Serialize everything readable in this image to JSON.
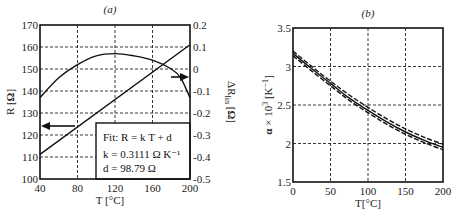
{
  "chart_data": [
    {
      "panel": "(a)",
      "type": "line",
      "title": "(a)",
      "xlabel": "T [°C]",
      "ylabel": "R [Ω]",
      "y2label": "ΔR_lin [Ω]",
      "xlim": [
        40,
        200
      ],
      "ylim": [
        100,
        170
      ],
      "y2lim": [
        -0.5,
        0.2
      ],
      "xticks": [
        "40",
        "80",
        "120",
        "160",
        "200"
      ],
      "yticks": [
        "100",
        "110",
        "120",
        "130",
        "140",
        "150",
        "160",
        "170"
      ],
      "y2ticks": [
        "-0.5",
        "-0.4",
        "-0.3",
        "-0.2",
        "-0.1",
        "0",
        "0.1",
        "0.2"
      ],
      "grid": true,
      "series": [
        {
          "name": "R (linear fit)",
          "axis": "left",
          "x": [
            40,
            80,
            120,
            160,
            200
          ],
          "values": [
            111.2,
            123.7,
            136.1,
            148.6,
            161.0
          ]
        },
        {
          "name": "ΔR_lin",
          "axis": "right",
          "x": [
            40,
            60,
            80,
            100,
            120,
            140,
            160,
            180,
            190,
            200
          ],
          "values": [
            -0.13,
            -0.04,
            0.02,
            0.06,
            0.07,
            0.06,
            0.04,
            0.0,
            -0.04,
            -0.13
          ]
        }
      ],
      "annotations": {
        "fit_line1": "Fit: R = k T + d",
        "fit_line2": "k = 0.3111 Ω K⁻¹",
        "fit_line3": "d = 98.79 Ω",
        "arrow_left": "points to R axis",
        "arrow_right": "points to ΔR_lin axis"
      }
    },
    {
      "panel": "(b)",
      "type": "line",
      "title": "(b)",
      "xlabel": "T[°C]",
      "ylabel": "α × 10³ [K⁻¹]",
      "xlim": [
        0,
        200
      ],
      "ylim": [
        1.5,
        3.5
      ],
      "xticks": [
        "0",
        "50",
        "100",
        "150",
        "200"
      ],
      "yticks": [
        "1.5",
        "2",
        "2.5",
        "3",
        "3.5"
      ],
      "grid": true,
      "series": [
        {
          "name": "α (solid)",
          "x": [
            0,
            25,
            50,
            75,
            100,
            125,
            150,
            175,
            200
          ],
          "values": [
            3.17,
            2.97,
            2.78,
            2.59,
            2.43,
            2.28,
            2.15,
            2.04,
            1.95
          ]
        },
        {
          "name": "α upper (dashed)",
          "x": [
            0,
            25,
            50,
            75,
            100,
            125,
            150,
            175,
            200
          ],
          "values": [
            3.2,
            3.0,
            2.81,
            2.63,
            2.47,
            2.32,
            2.19,
            2.08,
            1.99
          ]
        },
        {
          "name": "α lower (dashed)",
          "x": [
            0,
            25,
            50,
            75,
            100,
            125,
            150,
            175,
            200
          ],
          "values": [
            3.14,
            2.94,
            2.75,
            2.56,
            2.4,
            2.25,
            2.12,
            2.01,
            1.92
          ]
        }
      ]
    }
  ]
}
